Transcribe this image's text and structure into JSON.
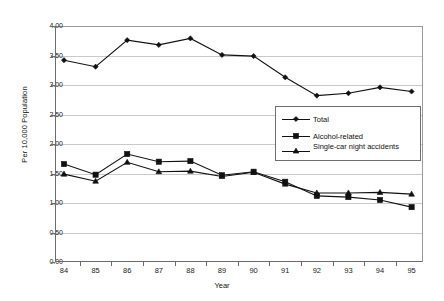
{
  "chart_data": {
    "type": "line",
    "title": "",
    "xlabel": "Year",
    "ylabel": "Per 10,000 Population",
    "categories": [
      "84",
      "85",
      "86",
      "87",
      "88",
      "89",
      "90",
      "91",
      "92",
      "93",
      "94",
      "95"
    ],
    "ylim": [
      0.0,
      4.0
    ],
    "ytick_labels": [
      "0.00",
      "0.50",
      "1.00",
      "1.50",
      "2.00",
      "2.50",
      "3.00",
      "3.50",
      "4.00"
    ],
    "ytick_values": [
      0.0,
      0.5,
      1.0,
      1.5,
      2.0,
      2.5,
      3.0,
      3.5,
      4.0
    ],
    "grid": true,
    "legend_position": "center-right",
    "series": [
      {
        "name": "Total",
        "marker": "diamond",
        "color": "#111111",
        "values": [
          3.42,
          3.31,
          3.76,
          3.68,
          3.79,
          3.51,
          3.49,
          3.13,
          2.82,
          2.86,
          2.96,
          2.89
        ]
      },
      {
        "name": "Alcohol-related",
        "marker": "square",
        "color": "#111111",
        "values": [
          1.66,
          1.48,
          1.83,
          1.7,
          1.71,
          1.47,
          1.53,
          1.36,
          1.12,
          1.1,
          1.05,
          0.93
        ]
      },
      {
        "name": "Single-car night accidents",
        "marker": "triangle",
        "color": "#111111",
        "values": [
          1.49,
          1.37,
          1.69,
          1.53,
          1.54,
          1.45,
          1.52,
          1.32,
          1.17,
          1.17,
          1.18,
          1.15
        ]
      }
    ]
  },
  "colors": {
    "background": "#ffffff",
    "axis": "#6b6b6b",
    "grid": "#c9c9c9",
    "ink": "#111111",
    "legend_border": "#6e6e6e"
  }
}
